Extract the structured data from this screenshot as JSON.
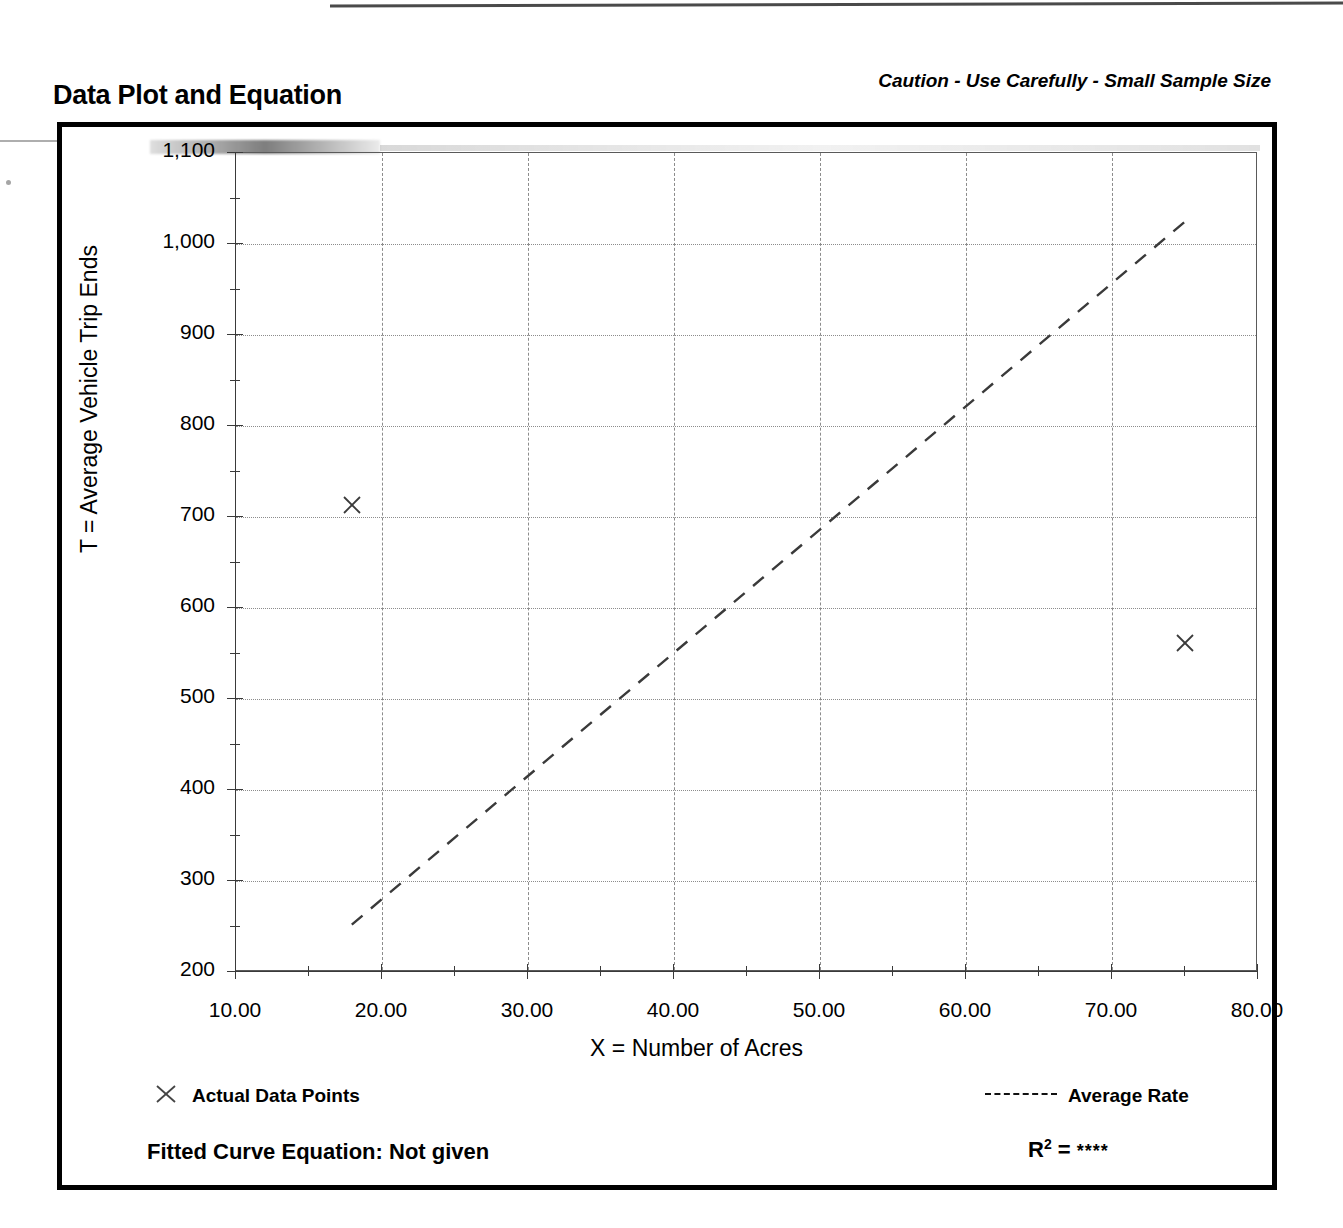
{
  "header": {
    "title": "Data Plot and Equation",
    "caution": "Caution - Use Carefully - Small Sample Size"
  },
  "legend": {
    "data_points_label": "Actual Data Points",
    "average_rate_label": "Average Rate",
    "point_marker_icon": "x-marker-icon",
    "rate_line_icon": "dashed-line-icon"
  },
  "equation": {
    "fitted_label": "Fitted Curve Equation:  Not given",
    "r_squared_symbol": "R",
    "r_squared_exponent": "2",
    "r_squared_equals": " = ",
    "r_squared_value": "****"
  },
  "colors": {
    "ink": "#000000",
    "grid": "#8c8c8c",
    "axis": "#3a3a3a"
  },
  "chart_data": {
    "type": "scatter",
    "title": "Data Plot and Equation",
    "subtitle": "Caution - Use Carefully - Small Sample Size",
    "xlabel": "X = Number of Acres",
    "ylabel": "T = Average Vehicle Trip Ends",
    "xlim": [
      10,
      80
    ],
    "ylim": [
      200,
      1100
    ],
    "xticks": [
      10,
      20,
      30,
      40,
      50,
      60,
      70,
      80
    ],
    "xtick_labels": [
      "10.00",
      "20.00",
      "30.00",
      "40.00",
      "50.00",
      "60.00",
      "70.00",
      "80.00"
    ],
    "xtick_minor_step": 5,
    "yticks": [
      200,
      300,
      400,
      500,
      600,
      700,
      800,
      900,
      1000,
      1100
    ],
    "ytick_labels": [
      "200",
      "300",
      "400",
      "500",
      "600",
      "700",
      "800",
      "900",
      "1,000",
      "1,100"
    ],
    "ytick_minor_step": 50,
    "grid": true,
    "grid_style": {
      "vertical": "dashed",
      "horizontal": "dotted"
    },
    "legend_position": "below-axes",
    "series": [
      {
        "name": "Actual Data Points",
        "type": "scatter",
        "marker": "x",
        "points": [
          {
            "x": 18.0,
            "y": 712
          },
          {
            "x": 75.1,
            "y": 560
          }
        ]
      },
      {
        "name": "Average Rate",
        "type": "line",
        "style": "dashed",
        "points": [
          {
            "x": 18.0,
            "y": 251
          },
          {
            "x": 75.1,
            "y": 1024
          }
        ],
        "slope_trips_per_acre": 13.56
      }
    ]
  }
}
